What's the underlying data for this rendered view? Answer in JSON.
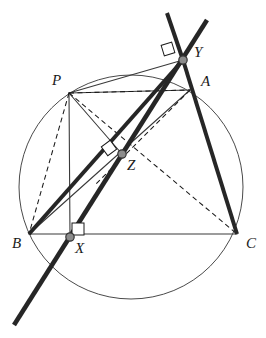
{
  "figure": {
    "type": "euclidean-geometry-diagram",
    "canvas": {
      "width": 266,
      "height": 338,
      "background": "#ffffff"
    }
  },
  "colors": {
    "stroke": "#1a1a1a",
    "thick_stroke": "#262626",
    "thin_stroke": "#3a3a3a",
    "circle_stroke": "#4a4a4a",
    "dot_fill": "#8c8c8c",
    "dot_stroke": "#333333",
    "label": "#1a1a1a"
  },
  "circle": {
    "cx": 131,
    "cy": 187,
    "r": 112,
    "stroke_width": 1
  },
  "points": [
    {
      "id": "P",
      "label": "P",
      "x": 69,
      "y": 93,
      "label_x": 52,
      "label_y": 73,
      "dot": false
    },
    {
      "id": "A",
      "label": "A",
      "x": 190,
      "y": 90,
      "label_x": 201,
      "label_y": 74,
      "dot": false
    },
    {
      "id": "B",
      "label": "B",
      "x": 29,
      "y": 234,
      "label_x": 12,
      "label_y": 236,
      "dot": false
    },
    {
      "id": "C",
      "label": "C",
      "x": 237,
      "y": 234,
      "label_x": 246,
      "label_y": 236,
      "dot": false
    },
    {
      "id": "X",
      "label": "X",
      "x": 70,
      "y": 237,
      "label_x": 75,
      "label_y": 241,
      "dot": true
    },
    {
      "id": "Y",
      "label": "Y",
      "x": 183,
      "y": 60,
      "label_x": 194,
      "label_y": 45,
      "dot": true
    },
    {
      "id": "Z",
      "label": "Z",
      "x": 122,
      "y": 154,
      "label_x": 127,
      "label_y": 158,
      "dot": true
    }
  ],
  "dot_radius": 4.2,
  "thin_segments": [
    {
      "name": "side-BC",
      "x1": 29,
      "y1": 234,
      "x2": 237,
      "y2": 234,
      "width": 1.1
    },
    {
      "name": "side-AB-upper",
      "x1": 190,
      "y1": 90,
      "x2": 29,
      "y2": 234,
      "width": 1.1
    },
    {
      "name": "perp-PX",
      "x1": 69,
      "y1": 93,
      "x2": 70,
      "y2": 237,
      "width": 1.1
    },
    {
      "name": "perp-PY",
      "x1": 69,
      "y1": 93,
      "x2": 183,
      "y2": 60,
      "width": 1.1
    },
    {
      "name": "perp-PZ",
      "x1": 69,
      "y1": 93,
      "x2": 122,
      "y2": 154,
      "width": 1.1
    },
    {
      "name": "chord-PA",
      "x1": 69,
      "y1": 93,
      "x2": 190,
      "y2": 90,
      "width": 1.0
    }
  ],
  "thick_segments": [
    {
      "name": "simson-line",
      "x1": 207,
      "y1": 20,
      "x2": 14,
      "y2": 325,
      "width": 4.6
    },
    {
      "name": "line-B-through-Z-to-Y",
      "x1": 29,
      "y1": 234,
      "x2": 183,
      "y2": 60,
      "width": 4.0
    },
    {
      "name": "line-Y-A-C",
      "x1": 183,
      "y1": 60,
      "x2": 237,
      "y2": 234,
      "width": 4.0
    },
    {
      "name": "line-top-left-extension",
      "x1": 167,
      "y1": 13,
      "x2": 183,
      "y2": 60,
      "width": 4.0
    }
  ],
  "dashed_segments": [
    {
      "name": "dash-PB",
      "x1": 69,
      "y1": 93,
      "x2": 29,
      "y2": 234
    },
    {
      "name": "dash-PA",
      "x1": 69,
      "y1": 93,
      "x2": 190,
      "y2": 90
    },
    {
      "name": "dash-PC",
      "x1": 69,
      "y1": 93,
      "x2": 237,
      "y2": 234
    },
    {
      "name": "dash-AZ-extended",
      "x1": 190,
      "y1": 90,
      "x2": 95,
      "y2": 185
    }
  ],
  "right_angle_marks": [
    {
      "name": "right-angle-at-Y",
      "cx": 168,
      "cy": 49,
      "size": 11,
      "rotate": -17
    },
    {
      "name": "right-angle-at-Z",
      "cx": 109,
      "cy": 148,
      "size": 11,
      "rotate": -36
    },
    {
      "name": "right-angle-at-X",
      "cx": 78,
      "cy": 229,
      "size": 12,
      "rotate": 0
    }
  ],
  "stroke_dasharray": "5,3.5"
}
